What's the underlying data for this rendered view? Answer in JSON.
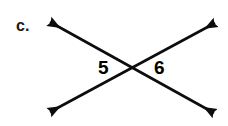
{
  "figure": {
    "part_label": "c.",
    "background_color": "#ffffff",
    "line_color": "#0d0d0d",
    "label_color": "#808080",
    "part_label_color": "#1a1a1a",
    "line_width": 2.6,
    "width": 228,
    "height": 126,
    "intersection": {
      "x": 132,
      "y": 69
    },
    "lines": [
      {
        "name": "line-nw-se",
        "description": "double-headed arrow from upper-left to lower-right",
        "x1": 50,
        "y1": 22,
        "x2": 214,
        "y2": 113
      },
      {
        "name": "line-sw-ne",
        "description": "double-headed arrow from lower-left to upper-right",
        "x1": 50,
        "y1": 112,
        "x2": 215,
        "y2": 23
      }
    ],
    "angle_labels": [
      {
        "name": "angle-5",
        "text": "5",
        "x": 104,
        "y": 68
      },
      {
        "name": "angle-6",
        "text": "6",
        "x": 160,
        "y": 68
      }
    ]
  }
}
